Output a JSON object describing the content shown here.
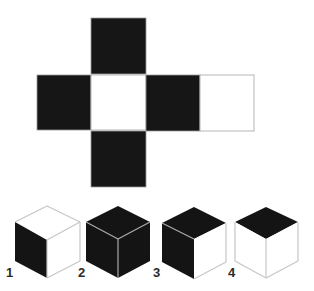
{
  "puzzle": {
    "type": "cube-net-folding",
    "net": {
      "faces": [
        {
          "id": "top",
          "color": "#161616",
          "x": 91,
          "y": 18,
          "size": 55
        },
        {
          "id": "left",
          "color": "#161616",
          "x": 37,
          "y": 75,
          "size": 55
        },
        {
          "id": "center",
          "color": "#ffffff",
          "x": 91,
          "y": 75,
          "size": 55
        },
        {
          "id": "right",
          "color": "#161616",
          "x": 146,
          "y": 75,
          "size": 55
        },
        {
          "id": "far-right",
          "color": "#ffffff",
          "x": 200,
          "y": 75,
          "size": 55
        },
        {
          "id": "bottom",
          "color": "#161616",
          "x": 91,
          "y": 131,
          "size": 55
        }
      ]
    },
    "options": [
      {
        "label": "1",
        "top": "#ffffff",
        "left": "#141414",
        "right": "#ffffff"
      },
      {
        "label": "2",
        "top": "#141414",
        "left": "#141414",
        "right": "#141414"
      },
      {
        "label": "3",
        "top": "#141414",
        "left": "#141414",
        "right": "#ffffff"
      },
      {
        "label": "4",
        "top": "#141414",
        "left": "#ffffff",
        "right": "#ffffff"
      }
    ]
  }
}
